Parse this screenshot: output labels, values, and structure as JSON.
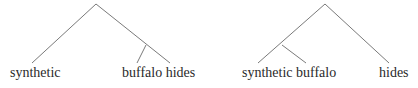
{
  "diagram": {
    "type": "constituency-trees",
    "line_color": "#7a7a7a",
    "trees": [
      {
        "id": "left",
        "structure": "[synthetic [buffalo hides]]",
        "labels": [
          {
            "text": "synthetic",
            "x": 10,
            "y": 66
          },
          {
            "text": "buffalo hides",
            "x": 122,
            "y": 66
          }
        ]
      },
      {
        "id": "right",
        "structure": "[[synthetic buffalo] hides]",
        "labels": [
          {
            "text": "synthetic buffalo",
            "x": 242,
            "y": 66
          },
          {
            "text": "hides",
            "x": 379,
            "y": 66
          }
        ]
      }
    ]
  }
}
